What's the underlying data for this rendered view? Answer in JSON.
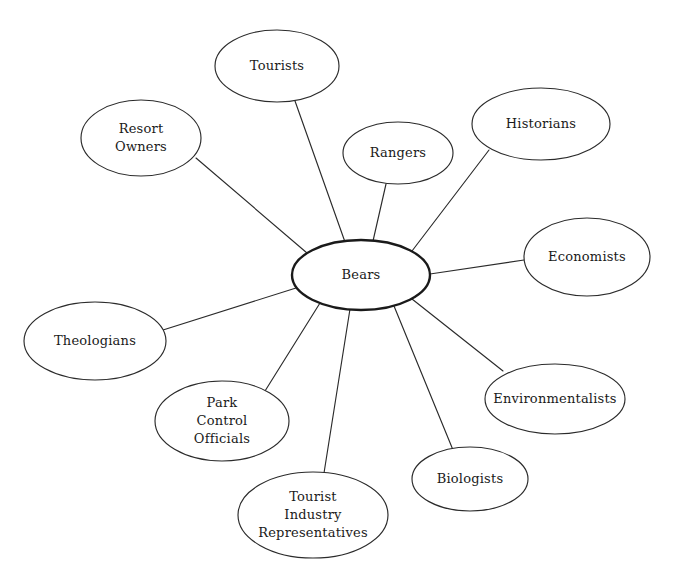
{
  "diagram": {
    "type": "mind-map",
    "background_color": "#ffffff",
    "line_color": "#2b2b2b",
    "text_color": "#1a1a1a",
    "central_node": {
      "id": "bears",
      "label": "Bears",
      "lines": [
        "Bears"
      ],
      "cx": 361,
      "cy": 275,
      "rx": 69,
      "ry": 35,
      "font_size": 13,
      "emphasis": "thick-border"
    },
    "nodes": [
      {
        "id": "tourists",
        "label": "Tourists",
        "lines": [
          "Tourists"
        ],
        "cx": 277,
        "cy": 66,
        "rx": 62,
        "ry": 36,
        "font_size": 13,
        "edge_from": {
          "x": 295,
          "y": 101
        },
        "edge_to": {
          "x": 345,
          "y": 242
        }
      },
      {
        "id": "resort-owners",
        "label": "Resort Owners",
        "lines": [
          "Resort",
          "Owners"
        ],
        "cx": 141,
        "cy": 138,
        "rx": 60,
        "ry": 38,
        "font_size": 13,
        "edge_from": {
          "x": 196,
          "y": 158
        },
        "edge_to": {
          "x": 307,
          "y": 253
        }
      },
      {
        "id": "rangers",
        "label": "Rangers",
        "lines": [
          "Rangers"
        ],
        "cx": 398,
        "cy": 153,
        "rx": 55,
        "ry": 31,
        "font_size": 13,
        "edge_from": {
          "x": 386,
          "y": 184
        },
        "edge_to": {
          "x": 373,
          "y": 241
        }
      },
      {
        "id": "historians",
        "label": "Historians",
        "lines": [
          "Historians"
        ],
        "cx": 541,
        "cy": 124,
        "rx": 69,
        "ry": 36,
        "font_size": 13,
        "edge_from": {
          "x": 489,
          "y": 150
        },
        "edge_to": {
          "x": 412,
          "y": 251
        }
      },
      {
        "id": "economists",
        "label": "Economists",
        "lines": [
          "Economists"
        ],
        "cx": 587,
        "cy": 257,
        "rx": 63,
        "ry": 39,
        "font_size": 13,
        "edge_from": {
          "x": 524,
          "y": 260
        },
        "edge_to": {
          "x": 430,
          "y": 274
        }
      },
      {
        "id": "environmentalists",
        "label": "Environmentalists",
        "lines": [
          "Environmentalists"
        ],
        "cx": 555,
        "cy": 399,
        "rx": 70,
        "ry": 35,
        "font_size": 13,
        "edge_from": {
          "x": 503,
          "y": 371
        },
        "edge_to": {
          "x": 412,
          "y": 299
        }
      },
      {
        "id": "biologists",
        "label": "Biologists",
        "lines": [
          "Biologists"
        ],
        "cx": 470,
        "cy": 479,
        "rx": 58,
        "ry": 32,
        "font_size": 13,
        "edge_from": {
          "x": 453,
          "y": 450
        },
        "edge_to": {
          "x": 394,
          "y": 306
        }
      },
      {
        "id": "tourist-industry-representatives",
        "label": "Tourist Industry Representatives",
        "lines": [
          "Tourist",
          "Industry",
          "Representatives"
        ],
        "cx": 313,
        "cy": 515,
        "rx": 75,
        "ry": 43,
        "font_size": 13,
        "edge_from": {
          "x": 324,
          "y": 473
        },
        "edge_to": {
          "x": 350,
          "y": 309
        }
      },
      {
        "id": "park-control-officials",
        "label": "Park Control Officials",
        "lines": [
          "Park",
          "Control",
          "Officials"
        ],
        "cx": 222,
        "cy": 421,
        "rx": 67,
        "ry": 40,
        "font_size": 13,
        "edge_from": {
          "x": 265,
          "y": 391
        },
        "edge_to": {
          "x": 320,
          "y": 303
        }
      },
      {
        "id": "theologians",
        "label": "Theologians",
        "lines": [
          "Theologians"
        ],
        "cx": 95,
        "cy": 341,
        "rx": 71,
        "ry": 39,
        "font_size": 13,
        "edge_from": {
          "x": 163,
          "y": 330
        },
        "edge_to": {
          "x": 296,
          "y": 288
        }
      }
    ]
  }
}
